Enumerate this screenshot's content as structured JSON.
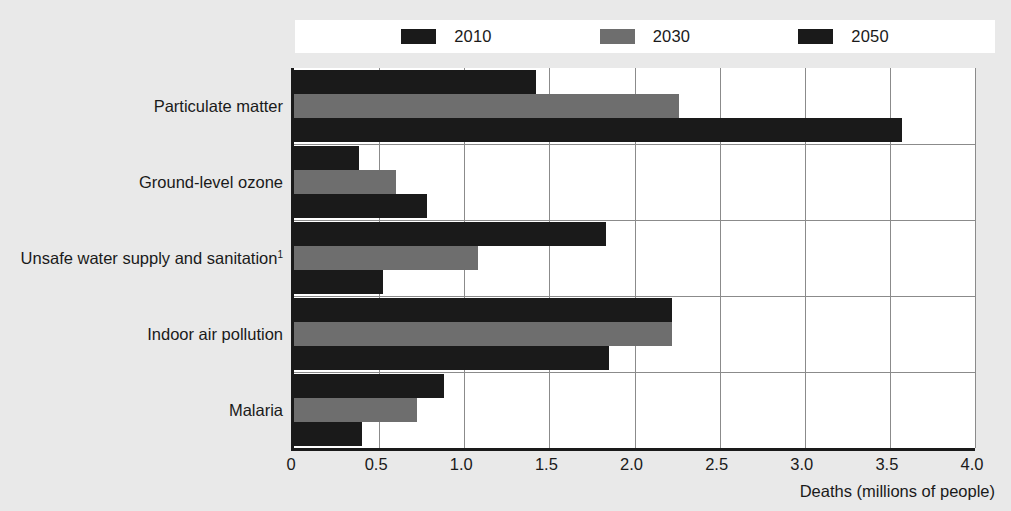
{
  "chart_data": {
    "type": "bar",
    "orientation": "horizontal",
    "title": "",
    "xlabel": "Deaths (millions of people)",
    "ylabel": "",
    "xlim": [
      0,
      4.0
    ],
    "xticks": [
      "0",
      "0.5",
      "1.0",
      "1.5",
      "2.0",
      "2.5",
      "3.0",
      "3.5",
      "4.0"
    ],
    "xtick_values": [
      0,
      0.5,
      1.0,
      1.5,
      2.0,
      2.5,
      3.0,
      3.5,
      4.0
    ],
    "grid": true,
    "grid_axis": "x",
    "legend_position": "top",
    "categories": [
      "Particulate matter",
      "Ground-level ozone",
      "Unsafe water supply and sanitation",
      "Indoor air pollution",
      "Malaria"
    ],
    "category_footnotes": [
      "",
      "",
      "1",
      "",
      ""
    ],
    "series": [
      {
        "name": "2010",
        "color": "#1a1a1a",
        "values": [
          1.42,
          0.38,
          1.83,
          2.22,
          0.88
        ]
      },
      {
        "name": "2030",
        "color": "#6e6e6e",
        "values": [
          2.26,
          0.6,
          1.08,
          2.22,
          0.72
        ]
      },
      {
        "name": "2050",
        "color": "#1a1a1a",
        "values": [
          3.57,
          0.78,
          0.52,
          1.85,
          0.4
        ]
      }
    ]
  },
  "legend": {
    "items": [
      {
        "label": "2010",
        "color": "#1a1a1a"
      },
      {
        "label": "2030",
        "color": "#6e6e6e"
      },
      {
        "label": "2050",
        "color": "#1a1a1a"
      }
    ]
  },
  "axis": {
    "x_title": "Deaths (millions of people)"
  },
  "colors": {
    "background": "#e9e9e9",
    "plot_background": "#ffffff",
    "axis": "#1a1a1a",
    "gridline": "#8b8b8b",
    "dark_bar": "#1a1a1a",
    "gray_bar": "#6e6e6e"
  }
}
